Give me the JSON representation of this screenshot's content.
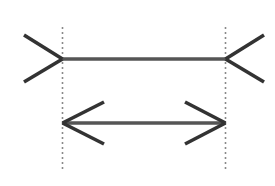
{
  "figure": {
    "name": "muller-lyer-illusion",
    "background_color": "#ffffff",
    "line_color": "#333333",
    "shaft_color": "#555555",
    "dashed_guide_color": "#8a8a8a",
    "canvas": {
      "width": 275,
      "height": 186
    }
  },
  "guides": {
    "left_x": 62.5,
    "right_x": 225.5,
    "y_top": 27,
    "y_bottom": 172,
    "dash_on": 2,
    "dash_off": 3,
    "stroke_width": 1.6
  },
  "shapes": {
    "top_figure": {
      "label": "outward-fins-line",
      "shaft": {
        "x1": 62.5,
        "y1": 59,
        "x2": 225.5,
        "y2": 59
      },
      "fins": [
        {
          "x1": 24,
          "y1": 35,
          "x2": 62.5,
          "y2": 59
        },
        {
          "x1": 24,
          "y1": 82,
          "x2": 62.5,
          "y2": 59
        },
        {
          "x1": 264,
          "y1": 35,
          "x2": 225.5,
          "y2": 59
        },
        {
          "x1": 264,
          "y1": 82,
          "x2": 225.5,
          "y2": 59
        }
      ]
    },
    "bottom_figure": {
      "label": "double-headed-arrow-line",
      "shaft": {
        "x1": 62.5,
        "y1": 123,
        "x2": 225.5,
        "y2": 123
      },
      "fins": [
        {
          "x1": 104,
          "y1": 102,
          "x2": 62.5,
          "y2": 123
        },
        {
          "x1": 104,
          "y1": 144,
          "x2": 62.5,
          "y2": 123
        },
        {
          "x1": 185,
          "y1": 102,
          "x2": 225.5,
          "y2": 123
        },
        {
          "x1": 185,
          "y1": 144,
          "x2": 225.5,
          "y2": 123
        }
      ]
    }
  },
  "chart_data": {
    "type": "diagram",
    "title": "",
    "subtitle": "",
    "xlabel": "",
    "ylabel": "",
    "annotations": [],
    "legend": [],
    "elements": [
      {
        "id": "top-line",
        "description": "horizontal line with outward-pointing fins at both ends",
        "arrowhead_direction": "outward",
        "shaft_length_px": 163,
        "shaft_y": 59,
        "start_x": 62.5,
        "end_x": 225.5
      },
      {
        "id": "bottom-line",
        "description": "horizontal line with inward-pointing arrowheads at both ends",
        "arrowhead_direction": "inward",
        "shaft_length_px": 163,
        "shaft_y": 123,
        "start_x": 62.5,
        "end_x": 225.5
      },
      {
        "id": "left-guide",
        "description": "vertical dashed reference line at left endpoints",
        "x": 62.5,
        "y_from": 27,
        "y_to": 172
      },
      {
        "id": "right-guide",
        "description": "vertical dashed reference line at right endpoints",
        "x": 225.5,
        "y_from": 27,
        "y_to": 172
      }
    ]
  }
}
